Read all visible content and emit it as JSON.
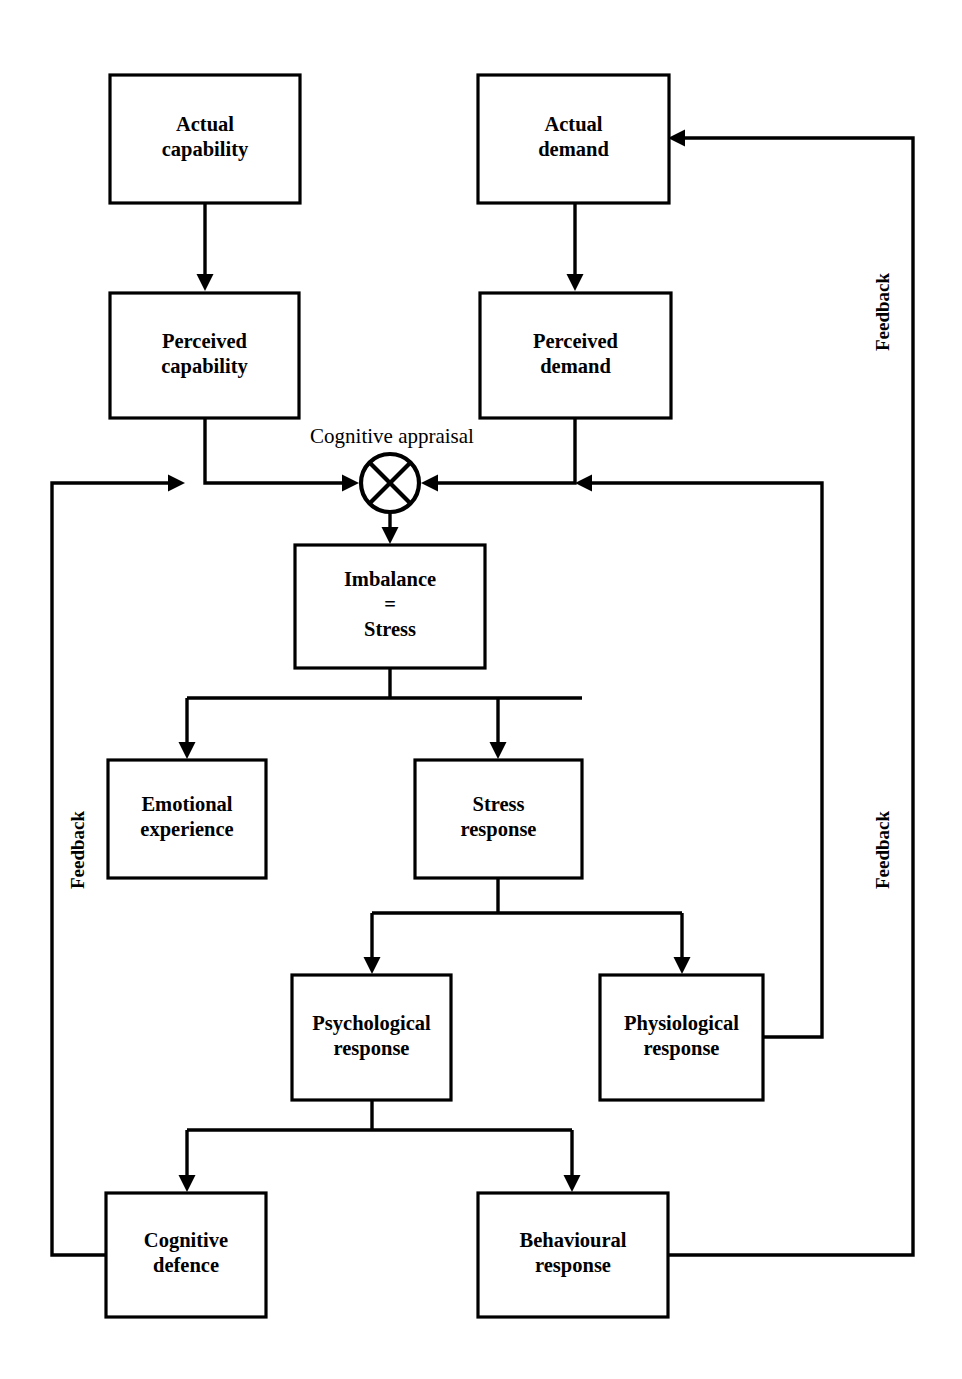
{
  "diagram": {
    "ink_color": "#000000",
    "background_color": "#ffffff",
    "boxes": [
      {
        "id": "actual-capability",
        "line1": "Actual",
        "line2": "capability",
        "x": 110,
        "y": 75,
        "w": 190,
        "h": 128
      },
      {
        "id": "actual-demand",
        "line1": "Actual",
        "line2": "demand",
        "x": 478,
        "y": 75,
        "w": 191,
        "h": 128
      },
      {
        "id": "perceived-capability",
        "line1": "Perceived",
        "line2": "capability",
        "x": 110,
        "y": 293,
        "w": 189,
        "h": 125
      },
      {
        "id": "perceived-demand",
        "line1": "Perceived",
        "line2": "demand",
        "x": 480,
        "y": 293,
        "w": 191,
        "h": 125
      },
      {
        "id": "imbalance-stress",
        "line1": "Imbalance",
        "line2": "=",
        "line3": "Stress",
        "x": 295,
        "y": 545,
        "w": 190,
        "h": 123
      },
      {
        "id": "emotional-experience",
        "line1": "Emotional",
        "line2": "experience",
        "x": 108,
        "y": 760,
        "w": 158,
        "h": 118
      },
      {
        "id": "stress-response",
        "line1": "Stress",
        "line2": "response",
        "x": 415,
        "y": 760,
        "w": 167,
        "h": 118
      },
      {
        "id": "psychological-response",
        "line1": "Psychological",
        "line2": "response",
        "x": 292,
        "y": 975,
        "w": 159,
        "h": 125
      },
      {
        "id": "physiological-response",
        "line1": "Physiological",
        "line2": "response",
        "x": 600,
        "y": 975,
        "w": 163,
        "h": 125
      },
      {
        "id": "cognitive-defence",
        "line1": "Cognitive",
        "line2": "defence",
        "x": 106,
        "y": 1193,
        "w": 160,
        "h": 124
      },
      {
        "id": "behavioural-response",
        "line1": "Behavioural",
        "line2": "response",
        "x": 478,
        "y": 1193,
        "w": 190,
        "h": 124
      }
    ],
    "node": {
      "id": "cognitive-appraisal-node",
      "label": "Cognitive appraisal",
      "label_x": 392,
      "label_y": 443,
      "cx": 390,
      "cy": 483,
      "r": 29
    },
    "feedback_labels": [
      {
        "id": "feedback-left",
        "text": "Feedback",
        "x": 84,
        "y": 850,
        "rotate": -90
      },
      {
        "id": "feedback-right-upper",
        "text": "Feedback",
        "x": 889,
        "y": 312,
        "rotate": -90
      },
      {
        "id": "feedback-right-lower",
        "text": "Feedback",
        "x": 889,
        "y": 850,
        "rotate": -90
      }
    ],
    "connector_paths": [
      {
        "id": "actual-capability-to-perceived-capability",
        "d": "M 205 203 L 205 281",
        "arrow": "down",
        "ax": 205,
        "ay": 291
      },
      {
        "id": "actual-demand-to-perceived-demand",
        "d": "M 575 203 L 575 281",
        "arrow": "down",
        "ax": 575,
        "ay": 291
      },
      {
        "id": "perceived-capability-to-appraisal",
        "d": "M 205 418 L 205 483 L 348 483",
        "arrow": "right",
        "ax": 359,
        "ay": 483
      },
      {
        "id": "perceived-demand-to-appraisal",
        "d": "M 575 418 L 575 483 L 432 483",
        "arrow": "left",
        "ax": 421,
        "ay": 483
      },
      {
        "id": "appraisal-to-imbalance",
        "d": "M 390 512 L 390 533",
        "arrow": "down",
        "ax": 390,
        "ay": 544
      },
      {
        "id": "imbalance-split-bar",
        "d": "M 390 668 L 390 698 M 187 698 L 582 698"
      },
      {
        "id": "imbalance-to-emotional",
        "d": "M 187 698 L 187 748",
        "arrow": "down",
        "ax": 187,
        "ay": 759
      },
      {
        "id": "imbalance-to-stress-response",
        "d": "M 498 698 L 498 748",
        "arrow": "down",
        "ax": 498,
        "ay": 759
      },
      {
        "id": "stress-response-split-bar",
        "d": "M 498 878 L 498 913 M 372 913 L 682 913"
      },
      {
        "id": "stress-to-psychological",
        "d": "M 372 913 L 372 963",
        "arrow": "down",
        "ax": 372,
        "ay": 974
      },
      {
        "id": "stress-to-physiological",
        "d": "M 682 913 L 682 963",
        "arrow": "down",
        "ax": 682,
        "ay": 974
      },
      {
        "id": "psychological-split-bar",
        "d": "M 372 1100 L 372 1130 M 187 1130 L 572 1130"
      },
      {
        "id": "psychological-to-cognitive-defence",
        "d": "M 187 1130 L 187 1181",
        "arrow": "down",
        "ax": 187,
        "ay": 1192
      },
      {
        "id": "psychological-to-behavioural",
        "d": "M 572 1130 L 572 1181",
        "arrow": "down",
        "ax": 572,
        "ay": 1192
      },
      {
        "id": "feedback-left-loop",
        "d": "M 106 1255 L 52 1255 L 52 483 L 174 483",
        "arrow": "right",
        "ax": 185,
        "ay": 483
      },
      {
        "id": "feedback-inner-right-loop",
        "d": "M 763 1037 L 822 1037 L 822 483 L 586 483",
        "arrow": "left",
        "ax": 575,
        "ay": 483
      },
      {
        "id": "feedback-outer-right-loop",
        "d": "M 668 1255 L 913 1255 L 913 138 L 679 138",
        "arrow": "left",
        "ax": 668,
        "ay": 138
      }
    ]
  }
}
